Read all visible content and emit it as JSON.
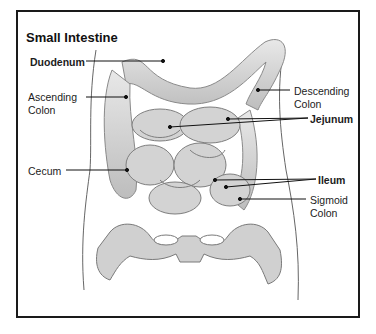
{
  "title": "Small Intestine",
  "labels": {
    "duodenum": "Duodenum",
    "ascending_colon_1": "Ascending",
    "ascending_colon_2": "Colon",
    "cecum": "Cecum",
    "descending_colon_1": "Descending",
    "descending_colon_2": "Colon",
    "jejunum": "Jejunum",
    "ileum": "Ileum",
    "sigmoid_colon_1": "Sigmoid",
    "sigmoid_colon_2": "Colon"
  },
  "colors": {
    "frame": "#1a1a1a",
    "organ_fill": "#d6d6d6",
    "organ_stroke": "#8a8a8a",
    "leader_line": "#111111"
  }
}
